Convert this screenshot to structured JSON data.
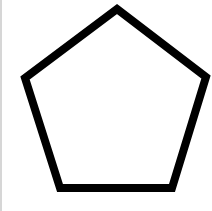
{
  "diagram": {
    "shape": "pentagon",
    "stroke_color": "#000000",
    "fill_color": "#ffffff",
    "stroke_width": 8,
    "points": "117,9 206,77 172,188 60,188 25,78"
  },
  "colors": {
    "background": "#ffffff",
    "edge_line": "#d6d6d6"
  }
}
